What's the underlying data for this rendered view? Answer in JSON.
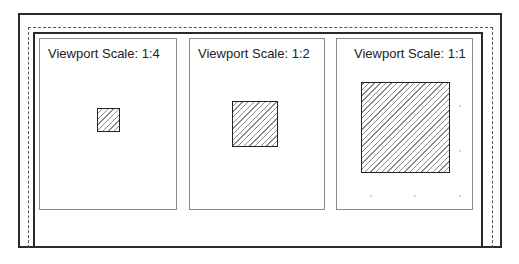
{
  "diagram": {
    "type": "layout-sheet-viewports",
    "colors": {
      "border": "#2a2a2a",
      "viewport_border": "#8a8a8a",
      "hatch": "#8a8a8a",
      "text": "#222222"
    },
    "viewports": [
      {
        "label": "Viewport Scale: 1:4",
        "scale": "1:4"
      },
      {
        "label": "Viewport Scale: 1:2",
        "scale": "1:2"
      },
      {
        "label": "Viewport Scale: 1:1",
        "scale": "1:1"
      }
    ]
  }
}
